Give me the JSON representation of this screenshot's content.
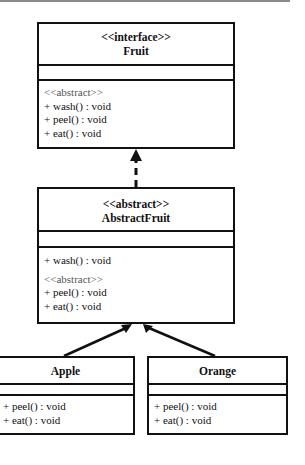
{
  "diagram": {
    "type": "uml-class-diagram",
    "classes": {
      "fruit": {
        "stereotype": "<<interface>>",
        "name": "Fruit",
        "attributes": [],
        "methods_stereotype": "<<abstract>>",
        "methods": [
          "+ wash() : void",
          "+ peel() : void",
          "+ eat() : void"
        ]
      },
      "abstract_fruit": {
        "stereotype": "<<abstract>>",
        "name": "AbstractFruit",
        "attributes": [],
        "concrete_methods": [
          "+ wash() : void"
        ],
        "methods_stereotype": "<<abstract>>",
        "methods": [
          "+ peel() : void",
          "+ eat() : void"
        ]
      },
      "apple": {
        "name": "Apple",
        "attributes": [],
        "methods": [
          "+ peel() : void",
          "+ eat() : void"
        ]
      },
      "orange": {
        "name": "Orange",
        "attributes": [],
        "methods": [
          "+ peel() : void",
          "+ eat() : void"
        ]
      }
    },
    "relationships": [
      {
        "from": "AbstractFruit",
        "to": "Fruit",
        "type": "realization",
        "style": "dashed-hollow-triangle"
      },
      {
        "from": "Apple",
        "to": "AbstractFruit",
        "type": "generalization",
        "style": "solid-triangle"
      },
      {
        "from": "Orange",
        "to": "AbstractFruit",
        "type": "generalization",
        "style": "solid-triangle"
      }
    ],
    "colors": {
      "line": "#111111",
      "background": "#ffffff",
      "stereotype_text": "#555555"
    }
  }
}
